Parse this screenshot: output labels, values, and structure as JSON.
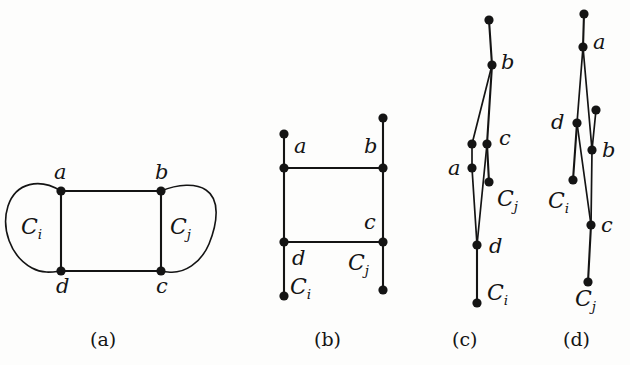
{
  "figure": {
    "background_color": "#fdfdfc",
    "ink_color": "#141414",
    "panels": [
      {
        "id": "a",
        "caption": "(a)",
        "vertex_labels": [
          "a",
          "b",
          "c",
          "d"
        ],
        "cluster_labels": [
          "C",
          "C"
        ],
        "cluster_subscripts": [
          "i",
          "j"
        ],
        "description": "Four-cycle a-b-c-d drawn as a rectangle with blob regions C_i on the left and C_j on the right"
      },
      {
        "id": "b",
        "caption": "(b)",
        "vertex_labels": [
          "a",
          "b",
          "c",
          "d"
        ],
        "cluster_labels": [
          "C",
          "C"
        ],
        "cluster_subscripts": [
          "i",
          "j"
        ],
        "description": "Rectangular drawing with vertical pendant edges; C_i attached at lower left, C_j attached at lower right"
      },
      {
        "id": "c",
        "caption": "(c)",
        "vertex_labels": [
          "a",
          "b",
          "c",
          "d"
        ],
        "cluster_labels": [
          "C",
          "C"
        ],
        "cluster_subscripts": [
          "j",
          "i"
        ],
        "description": "Narrow near-vertical drawing of the same four-cycle with C_j and C_i pendants"
      },
      {
        "id": "d",
        "caption": "(d)",
        "vertex_labels": [
          "a",
          "b",
          "c",
          "d"
        ],
        "cluster_labels": [
          "C",
          "C"
        ],
        "cluster_subscripts": [
          "i",
          "j"
        ],
        "description": "Narrow near-vertical alternative drawing with C_i and C_j pendants"
      }
    ],
    "captions": [
      "(a)",
      "(b)",
      "(c)",
      "(d)"
    ],
    "labels": {
      "panel_a": {
        "a": "a",
        "b": "b",
        "c": "c",
        "d": "d",
        "Ci": "C",
        "Ci_sub": "i",
        "Cj": "C",
        "Cj_sub": "j"
      },
      "panel_b": {
        "a": "a",
        "b": "b",
        "c": "c",
        "d": "d",
        "Ci": "C",
        "Ci_sub": "i",
        "Cj": "C",
        "Cj_sub": "j"
      },
      "panel_c": {
        "a": "a",
        "b": "b",
        "c": "c",
        "d": "d",
        "Cj": "C",
        "Cj_sub": "j",
        "Ci": "C",
        "Ci_sub": "i"
      },
      "panel_d": {
        "a": "a",
        "b": "b",
        "c": "c",
        "d": "d",
        "Ci": "C",
        "Ci_sub": "i",
        "Cj": "C",
        "Cj_sub": "j"
      }
    }
  }
}
